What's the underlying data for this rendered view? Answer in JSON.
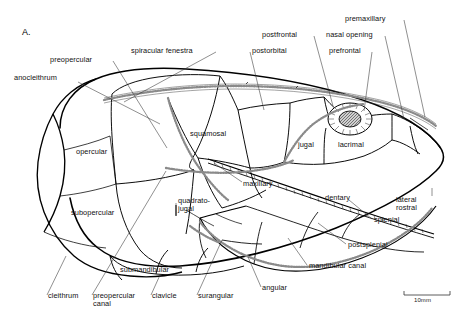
{
  "figure": {
    "panel_label": "A.",
    "domain": "scientific-anatomical-illustration",
    "ink_color": "#000000",
    "background_color": "#ffffff",
    "canal_color": "#8a8a8a"
  },
  "scale_bar": {
    "caption": "10mm",
    "length_px": 46
  },
  "labels": [
    {
      "id": "anocleithrum",
      "text": "anocleithrum",
      "x": 14,
      "y": 74,
      "align": "left",
      "leader": [
        [
          78,
          82
        ],
        [
          160,
          124
        ]
      ]
    },
    {
      "id": "preopercular",
      "text": "preopercular",
      "x": 50,
      "y": 56,
      "align": "left",
      "leader": [
        [
          113,
          61
        ],
        [
          167,
          148
        ]
      ]
    },
    {
      "id": "spiracular-fenestra",
      "text": "spiracular fenestra",
      "x": 131,
      "y": 47,
      "align": "left",
      "leader": [
        [
          216,
          52
        ],
        [
          124,
          102
        ]
      ]
    },
    {
      "id": "postorbital",
      "text": "postorbital",
      "x": 252,
      "y": 47,
      "align": "left",
      "leader": [
        [
          250,
          52
        ],
        [
          264,
          110
        ]
      ]
    },
    {
      "id": "postfrontal",
      "text": "postfrontal",
      "x": 262,
      "y": 31,
      "align": "left",
      "leader": [
        [
          314,
          36
        ],
        [
          333,
          106
        ]
      ]
    },
    {
      "id": "nasal-opening",
      "text": "nasal opening",
      "x": 326,
      "y": 31,
      "align": "left",
      "leader": [
        [
          385,
          36
        ],
        [
          404,
          119
        ]
      ]
    },
    {
      "id": "prefrontal",
      "text": "prefrontal",
      "x": 329,
      "y": 47,
      "align": "left",
      "leader": [
        [
          372,
          52
        ],
        [
          364,
          111
        ]
      ]
    },
    {
      "id": "premaxillary",
      "text": "premaxillary",
      "x": 345,
      "y": 15,
      "align": "left",
      "leader": [
        [
          404,
          20
        ],
        [
          425,
          117
        ]
      ]
    },
    {
      "id": "opercular",
      "text": "opercular",
      "x": 76,
      "y": 148,
      "align": "left",
      "leader": null
    },
    {
      "id": "squamosal",
      "text": "squamosal",
      "x": 190,
      "y": 130,
      "align": "left",
      "leader": null
    },
    {
      "id": "jugal",
      "text": "jugal",
      "x": 298,
      "y": 141,
      "align": "left",
      "leader": null
    },
    {
      "id": "lacrimal",
      "text": "lacrimal",
      "x": 338,
      "y": 141,
      "align": "left",
      "leader": null
    },
    {
      "id": "maxillary",
      "text": "maxillary",
      "x": 243,
      "y": 180,
      "align": "left",
      "leader": [
        [
          242,
          182
        ],
        [
          214,
          163
        ]
      ]
    },
    {
      "id": "quadratojugal",
      "text": "quadrato-\njugal",
      "x": 178,
      "y": 197,
      "align": "left",
      "leader": [
        [
          176,
          215
        ],
        [
          176,
          203
        ]
      ]
    },
    {
      "id": "dentary",
      "text": "dentary",
      "x": 325,
      "y": 194,
      "align": "left",
      "leader": null
    },
    {
      "id": "subopercular",
      "text": "subopercular",
      "x": 71,
      "y": 209,
      "align": "left",
      "leader": null
    },
    {
      "id": "submandibular",
      "text": "submandibular",
      "x": 120,
      "y": 266,
      "align": "left",
      "leader": null
    },
    {
      "id": "lateral-rostral",
      "text": "lateral\nrostral",
      "x": 396,
      "y": 196,
      "align": "left",
      "leader": [
        [
          432,
          196
        ],
        [
          432,
          188
        ]
      ]
    },
    {
      "id": "splenial",
      "text": "splenial",
      "x": 374,
      "y": 216,
      "align": "left",
      "leader": [
        [
          372,
          219
        ],
        [
          349,
          200
        ]
      ]
    },
    {
      "id": "postsplenial",
      "text": "postsplenial",
      "x": 348,
      "y": 241,
      "align": "left",
      "leader": [
        [
          346,
          244
        ],
        [
          318,
          223
        ]
      ]
    },
    {
      "id": "mandibular-canal",
      "text": "mandibular canal",
      "x": 309,
      "y": 262,
      "align": "left",
      "leader": [
        [
          307,
          265
        ],
        [
          288,
          238
        ]
      ]
    },
    {
      "id": "angular",
      "text": "angular",
      "x": 262,
      "y": 284,
      "align": "left",
      "leader": [
        [
          261,
          287
        ],
        [
          248,
          257
        ]
      ]
    },
    {
      "id": "cleithrum",
      "text": "cleithrum",
      "x": 48,
      "y": 292,
      "align": "left",
      "leader": [
        [
          47,
          295
        ],
        [
          66,
          256
        ]
      ]
    },
    {
      "id": "preopercular-canal",
      "text": "preopercular\ncanal",
      "x": 93,
      "y": 292,
      "align": "left",
      "leader": [
        [
          92,
          295
        ],
        [
          166,
          171
        ]
      ]
    },
    {
      "id": "clavicle",
      "text": "clavicle",
      "x": 152,
      "y": 292,
      "align": "left",
      "leader": [
        [
          151,
          295
        ],
        [
          160,
          275
        ]
      ]
    },
    {
      "id": "surangular",
      "text": "surangular",
      "x": 198,
      "y": 292,
      "align": "left",
      "leader": [
        [
          197,
          295
        ],
        [
          222,
          240
        ]
      ]
    }
  ]
}
